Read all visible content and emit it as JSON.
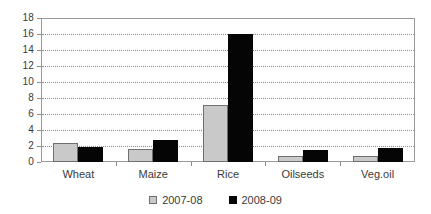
{
  "chart_data": {
    "type": "bar",
    "title": "",
    "subtitle": "",
    "xlabel": "",
    "ylabel": "",
    "categories": [
      "Wheat",
      "Maize",
      "Rice",
      "Oilseeds",
      "Veg.oil"
    ],
    "series": [
      {
        "name": "2007-08",
        "color": "#c9c9c9",
        "values": [
          2.4,
          1.6,
          7.1,
          0.7,
          0.8
        ]
      },
      {
        "name": "2008-09",
        "color": "#050505",
        "values": [
          1.9,
          2.7,
          16.0,
          1.45,
          1.7
        ]
      }
    ],
    "ylim": [
      0,
      18
    ],
    "ytick_step": 2,
    "ytick_labels": [
      "0",
      "2",
      "4",
      "6",
      "8",
      "10",
      "12",
      "14",
      "16",
      "18"
    ],
    "grid": true,
    "grid_axis": "y",
    "grid_style": "dotted",
    "legend_position": "bottom-center",
    "plot_border": true,
    "background_color": "#ffffff",
    "axis_color": "#9a9a9a",
    "text_color": "#3a3a3a"
  }
}
